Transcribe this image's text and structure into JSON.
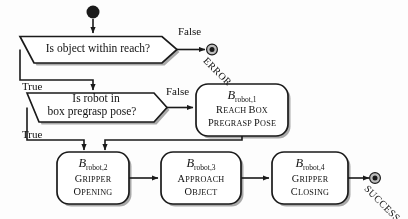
{
  "diagram": {
    "colors": {
      "stroke": "#1a1a1a",
      "fill": "#ffffff",
      "shadow": "#9a9a9a",
      "background": "#fdfdfd",
      "text": "#111111"
    },
    "start": {
      "name": "start-node",
      "shape": "filled-circle"
    },
    "decisions": [
      {
        "id": "d1",
        "text_lines": [
          "Is object within reach?"
        ],
        "true_label": "True",
        "false_label": "False"
      },
      {
        "id": "d2",
        "text_lines": [
          "Is robot in",
          "box pregrasp pose?"
        ],
        "true_label": "True",
        "false_label": "False"
      }
    ],
    "actions": [
      {
        "id": "a1",
        "head_symbol": "B",
        "head_sub": "robot,1",
        "body_lines": [
          "Reach box",
          "pregrasp pose"
        ]
      },
      {
        "id": "a2",
        "head_symbol": "B",
        "head_sub": "robot,2",
        "body_lines": [
          "Gripper",
          "opening"
        ]
      },
      {
        "id": "a3",
        "head_symbol": "B",
        "head_sub": "robot,3",
        "body_lines": [
          "Approach",
          "object"
        ]
      },
      {
        "id": "a4",
        "head_symbol": "B",
        "head_sub": "robot,4",
        "body_lines": [
          "Gripper",
          "closing"
        ]
      }
    ],
    "terminals": [
      {
        "id": "t-error",
        "label": "ERROR"
      },
      {
        "id": "t-success",
        "label": "SUCCESS"
      }
    ]
  }
}
